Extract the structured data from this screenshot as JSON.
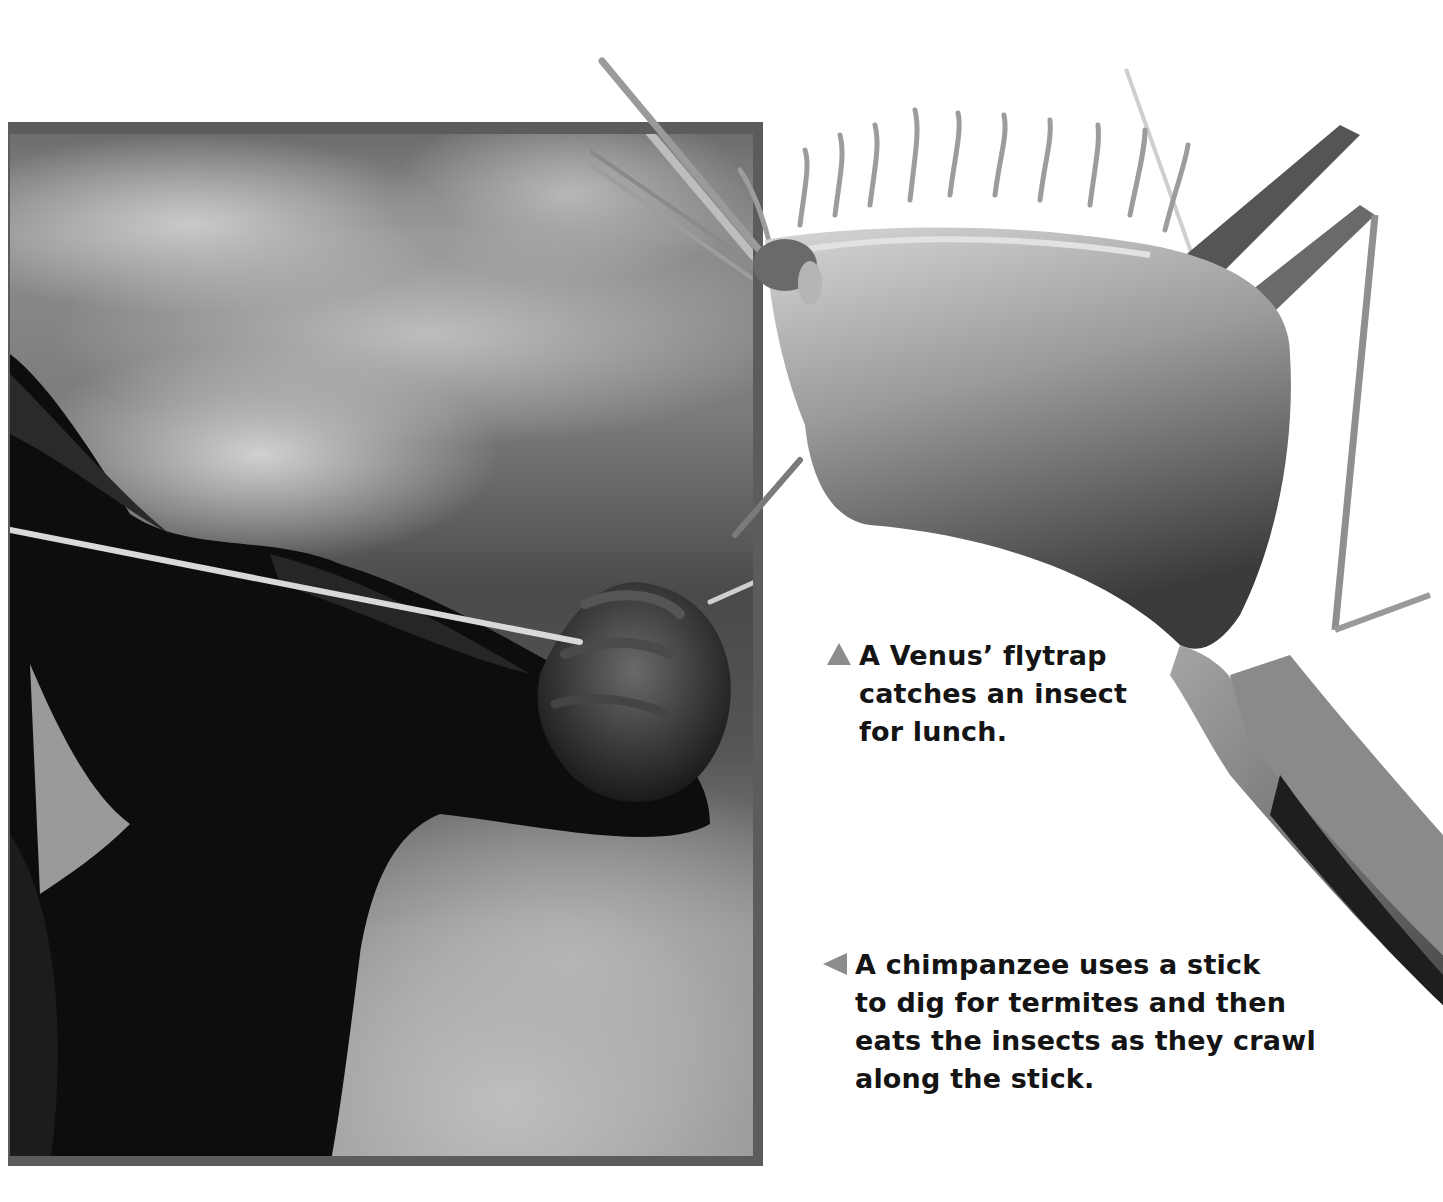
{
  "figures": {
    "chimpanzee_photo": {
      "subject": "chimpanzee-hand-holding-stick",
      "style": "grayscale photograph with dark gray border"
    },
    "flytrap_photo": {
      "subject": "venus-flytrap-catching-insect",
      "style": "grayscale cut-out photograph"
    }
  },
  "captions": {
    "flytrap": {
      "marker": "triangle-up",
      "lines": [
        "A Venus’ flytrap",
        "catches an insect",
        "for lunch."
      ]
    },
    "chimpanzee": {
      "marker": "triangle-left",
      "lines": [
        "A chimpanzee uses a stick",
        "to dig for termites and then",
        "eats the insects as they crawl",
        "along the stick."
      ]
    }
  },
  "colors": {
    "text": "#141414",
    "marker": "#8c8c8c",
    "frame_border": "#5c5c5c",
    "background": "#ffffff"
  }
}
